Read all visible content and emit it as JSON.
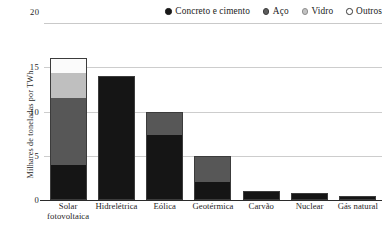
{
  "legend": {
    "items": [
      {
        "label": "Concreto e cimento",
        "marker": "filled-circle-black",
        "color": "#151515",
        "key": "concrete"
      },
      {
        "label": "Aço",
        "marker": "filled-circle-dark-gray",
        "color": "#575757",
        "key": "steel"
      },
      {
        "label": "Vidro",
        "marker": "filled-circle-light-gray",
        "color": "#bfbfbf",
        "key": "glass"
      },
      {
        "label": "Outros",
        "marker": "open-circle-white",
        "color": "#fbfbfb",
        "key": "other"
      }
    ]
  },
  "axis": {
    "y_title": "Milhares de toneladas por TWh",
    "y_max_label": "20",
    "y_ticks": [
      "0",
      "5",
      "10",
      "15"
    ]
  },
  "categories_display": [
    {
      "line1": "Solar",
      "line2": "fotovoltaica"
    },
    {
      "line1": "Hidrelétrica",
      "line2": ""
    },
    {
      "line1": "Eólica",
      "line2": ""
    },
    {
      "line1": "Geotérmica",
      "line2": ""
    },
    {
      "line1": "Carvão",
      "line2": ""
    },
    {
      "line1": "Nuclear",
      "line2": ""
    },
    {
      "line1": "Gás natural",
      "line2": ""
    }
  ],
  "chart_data": {
    "type": "bar",
    "subtype": "stacked-vertical",
    "title": "",
    "xlabel": "",
    "ylabel": "Milhares de toneladas por TWh",
    "ylim": [
      0,
      20
    ],
    "yticks": [
      0,
      5,
      10,
      15,
      20
    ],
    "grid": "horizontal",
    "legend_position": "top-right",
    "categories": [
      "Solar fotovoltaica",
      "Hidrelétrica",
      "Eólica",
      "Geotérmica",
      "Carvão",
      "Nuclear",
      "Gás natural"
    ],
    "series": [
      {
        "name": "Concreto e cimento",
        "color": "#151515",
        "values": [
          4.0,
          13.9,
          7.3,
          2.0,
          1.0,
          0.8,
          0.5
        ]
      },
      {
        "name": "Aço",
        "color": "#575757",
        "values": [
          7.5,
          0.1,
          2.7,
          3.0,
          0.0,
          0.0,
          0.0
        ]
      },
      {
        "name": "Vidro",
        "color": "#bfbfbf",
        "values": [
          2.8,
          0.0,
          0.0,
          0.0,
          0.0,
          0.0,
          0.0
        ]
      },
      {
        "name": "Outros",
        "color": "#fbfbfb",
        "values": [
          1.7,
          0.0,
          0.0,
          0.0,
          0.0,
          0.0,
          0.0
        ]
      }
    ],
    "totals": [
      16.0,
      14.0,
      10.0,
      5.0,
      1.0,
      0.8,
      0.5
    ]
  }
}
